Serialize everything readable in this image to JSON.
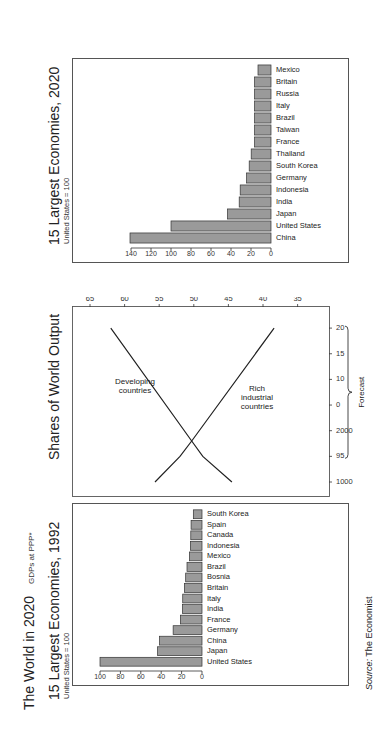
{
  "header": {
    "title": "The World in 2020",
    "subtitle": "GDPs at PPP*"
  },
  "source": {
    "label": "Source:",
    "value": "The Economist"
  },
  "colors": {
    "bar_fill": "#9a9a9a",
    "bar_stroke": "#333333",
    "line": "#222222",
    "frame": "#555555"
  },
  "panels": {
    "left": {
      "title": "15 Largest Economies, 1992",
      "subtitle": "United States = 100"
    },
    "middle": {
      "title": "Shares of World Output",
      "label_developing_1": "Developing",
      "label_developing_2": "countries",
      "label_rich_1": "Rich",
      "label_rich_2": "industrial",
      "label_rich_3": "countries",
      "forecast_label": "Forecast",
      "pct_label": "%"
    },
    "right": {
      "title": "15 Largest Economies, 2020",
      "subtitle": "United States = 100"
    }
  },
  "chart_data": [
    {
      "type": "bar",
      "title": "15 Largest Economies, 1992",
      "subtitle": "United States = 100",
      "categories": [
        "United States",
        "Japan",
        "China",
        "Germany",
        "France",
        "India",
        "Italy",
        "Britain",
        "Bosnia",
        "Brazil",
        "Mexico",
        "Indonesia",
        "Canada",
        "Spain",
        "South Korea"
      ],
      "values": [
        100,
        43.6,
        41.7,
        28.3,
        21.2,
        19.2,
        18.9,
        17.3,
        16,
        14.7,
        12.4,
        11.4,
        11,
        10.7,
        8.5
      ],
      "yticks": [
        0,
        20,
        40,
        60,
        80,
        100
      ],
      "ylim": [
        0,
        100
      ],
      "xlabel": "",
      "ylabel": "",
      "grid": false
    },
    {
      "type": "line",
      "title": "Shares of World Output",
      "x": [
        "1000",
        "95",
        "2000",
        "0",
        "10",
        "15",
        "20"
      ],
      "x_numeric": [
        1990,
        1995,
        2000,
        2005,
        2010,
        2015,
        2020
      ],
      "series": [
        {
          "name": "Developing countries",
          "points": [
            [
              1990,
              44.5
            ],
            [
              1995,
              48.7
            ],
            [
              1998,
              50.3
            ],
            [
              2020,
              62
            ]
          ]
        },
        {
          "name": "Rich industrial countries",
          "points": [
            [
              1990,
              55.6
            ],
            [
              1995,
              52
            ],
            [
              1998,
              50.3
            ],
            [
              2020,
              38.4
            ]
          ]
        }
      ],
      "yticks": [
        "65",
        "60",
        "55",
        "50 %",
        "45",
        "40",
        "35"
      ],
      "ylim": [
        33,
        66
      ],
      "annotation": "Forecast",
      "forecast_range": [
        1995,
        2020
      ],
      "grid": false
    },
    {
      "type": "bar",
      "title": "15 Largest Economies, 2020",
      "subtitle": "United States = 100",
      "categories": [
        "China",
        "United States",
        "Japan",
        "India",
        "Indonesia",
        "Germany",
        "South Korea",
        "Thailand",
        "France",
        "Taiwan",
        "Brazil",
        "Italy",
        "Russia",
        "Britain",
        "Mexico"
      ],
      "values": [
        141,
        100,
        43.5,
        31.8,
        30.8,
        24.4,
        21.8,
        19.8,
        16.4,
        16.4,
        16.4,
        16.4,
        16.4,
        16.4,
        13
      ],
      "yticks": [
        0,
        20,
        40,
        60,
        80,
        100,
        120,
        140
      ],
      "ylim": [
        0,
        140
      ],
      "xlabel": "",
      "ylabel": "",
      "grid": false
    }
  ]
}
